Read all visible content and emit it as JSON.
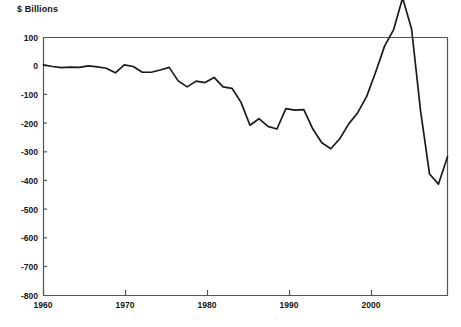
{
  "chart_data": {
    "type": "line",
    "title": "",
    "ylabel": "$ Billions",
    "xlabel": "",
    "ylim": [
      -800,
      100
    ],
    "xlim": [
      1960,
      2005
    ],
    "grid": false,
    "legend": null,
    "yticks": [
      100,
      0,
      -100,
      -200,
      -300,
      -400,
      -500,
      -600,
      -700,
      -800
    ],
    "ytick_labels": [
      "100",
      "0",
      "-100",
      "-200",
      "-300",
      "-400",
      "-500",
      "-600",
      "-700",
      "-800"
    ],
    "xticks": [
      1960,
      1970,
      1980,
      1990,
      2000
    ],
    "xtick_labels": [
      "1960",
      "1970",
      "1980",
      "1990",
      "2000"
    ],
    "line_color": "#1a1a1a",
    "series": [
      {
        "name": "Federal surplus or deficit",
        "x": [
          1960,
          1961,
          1962,
          1963,
          1964,
          1965,
          1966,
          1967,
          1968,
          1969,
          1970,
          1971,
          1972,
          1973,
          1974,
          1975,
          1976,
          1977,
          1978,
          1979,
          1980,
          1981,
          1982,
          1983,
          1984,
          1985,
          1986,
          1987,
          1988,
          1989,
          1990,
          1991,
          1992,
          1993,
          1994,
          1995,
          1996,
          1997,
          1998,
          1999,
          2000,
          2001,
          2002,
          2003,
          2004,
          2005
        ],
        "values": [
          3,
          -3,
          -7,
          -5,
          -6,
          -1,
          -4,
          -9,
          -25,
          3,
          -3,
          -23,
          -23,
          -15,
          -6,
          -53,
          -74,
          -54,
          -59,
          -41,
          -74,
          -79,
          -128,
          -208,
          -185,
          -212,
          -221,
          -150,
          -155,
          -153,
          -221,
          -269,
          -290,
          -255,
          -203,
          -164,
          -107,
          -22,
          69,
          126,
          236,
          128,
          -158,
          -378,
          -413,
          -318
        ]
      }
    ]
  },
  "axes": {
    "frame_color": "#555555"
  }
}
